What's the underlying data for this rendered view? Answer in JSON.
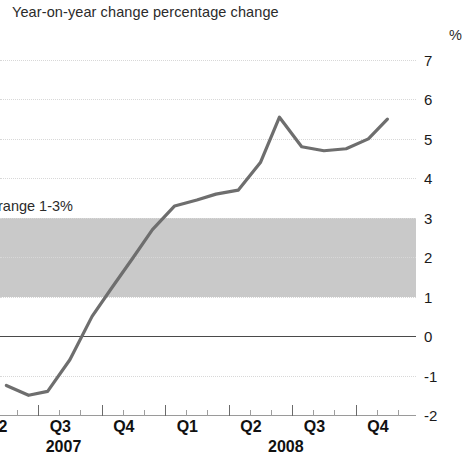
{
  "header": {
    "title": "Year-on-year change percentage change",
    "unit": "%"
  },
  "annotations": {
    "band_note": "range 1-3%"
  },
  "chart_data": {
    "type": "line",
    "title": "Year-on-year change percentage change",
    "xlabel": "",
    "ylabel": "%",
    "ylim": [
      -2,
      7
    ],
    "yticks": [
      7,
      6,
      5,
      4,
      3,
      2,
      1,
      0,
      -1,
      -2
    ],
    "ytick_labels": [
      "7",
      "6",
      "5",
      "4",
      "3",
      "2",
      "1",
      "0",
      "-1",
      "-2"
    ],
    "grid": true,
    "legend": "none",
    "zero_line": 0,
    "target_band": {
      "label": "range 1-3%",
      "lower": 1,
      "upper": 3,
      "color": "#c9c9c9"
    },
    "series": [
      {
        "name": "Year-on-year percentage change",
        "color": "#6e6e6e",
        "x": [
          0.1,
          0.45,
          0.75,
          1.1,
          1.45,
          1.75,
          2.1,
          2.4,
          2.75,
          3.1,
          3.4,
          3.75,
          4.1,
          4.4,
          4.75,
          5.1,
          5.45,
          5.8,
          6.1
        ],
        "values": [
          -1.25,
          -1.5,
          -1.4,
          -0.6,
          0.5,
          1.2,
          2.0,
          2.7,
          3.3,
          3.45,
          3.6,
          3.7,
          4.4,
          5.55,
          4.8,
          4.7,
          4.75,
          5.0,
          5.5
        ]
      }
    ],
    "x_major_ticks": [
      "Q2",
      "Q3",
      "Q4",
      "Q1",
      "Q2",
      "Q3",
      "Q4"
    ],
    "x_years": [
      "2007",
      "2008"
    ],
    "x_axis_labels": [
      {
        "label": "Q2",
        "year": "2007"
      },
      {
        "label": "Q3",
        "year": "2007"
      },
      {
        "label": "Q4",
        "year": "2007"
      },
      {
        "label": "Q1",
        "year": "2008"
      },
      {
        "label": "Q2",
        "year": "2008"
      },
      {
        "label": "Q3",
        "year": "2008"
      },
      {
        "label": "Q4",
        "year": "2008"
      }
    ]
  },
  "axis": {
    "y_labels": [
      "7",
      "6",
      "5",
      "4",
      "3",
      "2",
      "1",
      "0",
      "-1",
      "-2"
    ],
    "x_quarters": [
      "Q2",
      "Q3",
      "Q4",
      "Q1",
      "Q2",
      "Q3",
      "Q4"
    ],
    "x_years": [
      "2007",
      "2008"
    ]
  }
}
